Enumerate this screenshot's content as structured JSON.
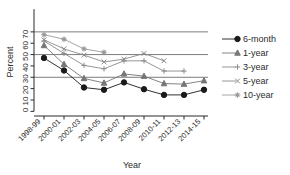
{
  "chart_data": {
    "type": "line",
    "title": "",
    "xlabel": "Year",
    "ylabel": "Percent",
    "categories": [
      "1998-99",
      "2000-01",
      "2002-03",
      "2004-05",
      "2006-07",
      "2008-09",
      "2010-11",
      "2012-13",
      "2014-15"
    ],
    "yticks": [
      0,
      10,
      20,
      30,
      40,
      50,
      60,
      70
    ],
    "ylim": [
      0,
      70
    ],
    "grid": true,
    "gridlines": [
      20,
      40,
      60
    ],
    "legend_position": "right",
    "series": [
      {
        "name": "6-month",
        "marker": "filled-circle",
        "color": "#1a1a1a",
        "values": [
          47,
          36,
          21,
          19,
          25.5,
          19.5,
          14.5,
          14.5,
          19
        ]
      },
      {
        "name": "1-year",
        "marker": "filled-triangle",
        "color": "#767676",
        "values": [
          58,
          41.5,
          29,
          25,
          33,
          31,
          24.5,
          24,
          27
        ]
      },
      {
        "name": "3-year",
        "marker": "plus",
        "color": "#8a8a8a",
        "values": [
          62,
          51,
          40.5,
          37.5,
          44.5,
          44.5,
          35.5,
          35.5,
          null
        ]
      },
      {
        "name": "5-year",
        "marker": "cross",
        "color": "#8a8a8a",
        "values": [
          63,
          55,
          49.5,
          43.5,
          46,
          51,
          44.5,
          null,
          null
        ]
      },
      {
        "name": "10-year",
        "marker": "asterisk",
        "color": "#9a9a9a",
        "values": [
          67.5,
          63.5,
          55,
          52,
          null,
          null,
          null,
          null,
          null
        ]
      }
    ]
  },
  "legend": {
    "entries": [
      {
        "label": "6-month"
      },
      {
        "label": "1-year"
      },
      {
        "label": "3-year"
      },
      {
        "label": "5-year"
      },
      {
        "label": "10-year"
      }
    ]
  },
  "axes": {
    "y_tick_text": "0 10 20 30 40 50 60 70",
    "y_title": "Percent",
    "x_title": "Year"
  }
}
